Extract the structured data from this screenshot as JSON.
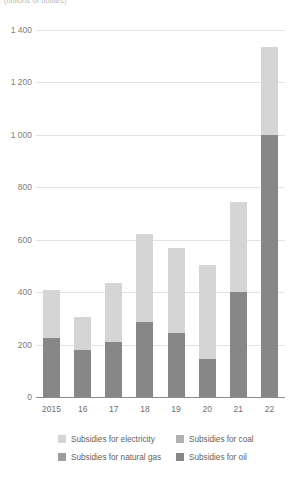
{
  "units_caption": "(billions of dollars)",
  "chart_data": {
    "type": "bar",
    "stacked": true,
    "title": "",
    "subtitle": "(billions of dollars)",
    "xlabel": "",
    "ylabel": "(billions of dollars)",
    "ylim": [
      0,
      1400
    ],
    "yticks": [
      0,
      200,
      400,
      600,
      800,
      1000,
      1200,
      1400
    ],
    "ytick_labels": [
      "0",
      "200",
      "400",
      "600",
      "800",
      "1 000",
      "1 200",
      "1 400"
    ],
    "grid": true,
    "legend_position": "bottom",
    "categories": [
      "2015",
      "16",
      "17",
      "18",
      "19",
      "20",
      "21",
      "22"
    ],
    "series": [
      {
        "name": "Subsidies for oil",
        "color": "#878787",
        "values": [
          225,
          180,
          210,
          285,
          245,
          145,
          400,
          1000
        ]
      },
      {
        "name": "Subsidies for natural gas",
        "color": "#9d9d9d",
        "values": [
          0,
          0,
          0,
          0,
          0,
          0,
          0,
          0
        ]
      },
      {
        "name": "Subsidies for coal",
        "color": "#b0b0b0",
        "values": [
          0,
          0,
          0,
          0,
          0,
          0,
          0,
          0
        ]
      },
      {
        "name": "Subsidies for electricity",
        "color": "#d5d5d5",
        "values": [
          185,
          125,
          225,
          335,
          325,
          360,
          345,
          335
        ]
      }
    ],
    "totals": [
      410,
      305,
      435,
      620,
      570,
      505,
      745,
      1335
    ]
  },
  "legend": {
    "items": [
      {
        "label": "Subsidies for electricity",
        "color": "#d5d5d5"
      },
      {
        "label": "Subsidies for coal",
        "color": "#b0b0b0"
      },
      {
        "label": "Subsidies for natural gas",
        "color": "#9d9d9d"
      },
      {
        "label": "Subsidies for oil",
        "color": "#878787"
      }
    ]
  }
}
